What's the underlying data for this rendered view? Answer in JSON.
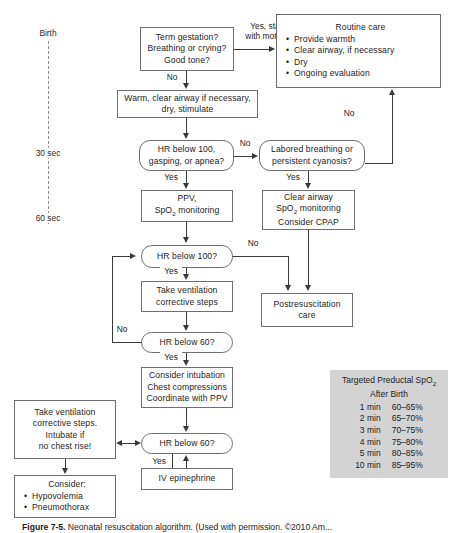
{
  "figure": {
    "caption_label": "Figure 7-5.",
    "caption_text": "Neonatal resuscitation algorithm. (Used with permission. ©2010 Am..."
  },
  "timeline": {
    "labels": [
      {
        "text": "Birth",
        "y": 28
      },
      {
        "text": "30 sec",
        "y": 148
      },
      {
        "text": "60 sec",
        "y": 213
      }
    ]
  },
  "nodes": {
    "initial_assessment": {
      "lines": [
        "Term gestation?",
        "Breathing or crying?",
        "Good tone?"
      ]
    },
    "routine_care": {
      "title": "Routine care",
      "items": [
        "Provide warmth",
        "Clear airway, if necessary",
        "Dry",
        "Ongoing evaluation"
      ]
    },
    "warm_clear": {
      "lines": [
        "Warm, clear airway if necessary,",
        "dry, stimulate"
      ]
    },
    "hr_below_100_gasping": {
      "lines": [
        "HR below 100,",
        "gasping, or apnea?"
      ]
    },
    "labored_breathing": {
      "lines": [
        "Labored breathing or",
        "persistent cyanosis?"
      ]
    },
    "ppv_spo2": {
      "lines": [
        "PPV,",
        "SpO",
        "₂",
        " monitoring"
      ],
      "line1": "PPV,",
      "line2_pre": "SpO",
      "line2_sub": "2",
      "line2_post": " monitoring"
    },
    "clear_airway": {
      "line1": "Clear airway",
      "line2_pre": "SpO",
      "line2_sub": "2",
      "line2_post": " monitoring",
      "line3": "Consider CPAP"
    },
    "hr_below_100": {
      "lines": [
        "HR below 100?"
      ]
    },
    "take_ventilation_steps": {
      "lines": [
        "Take ventilation",
        "corrective steps"
      ]
    },
    "postresuscitation": {
      "lines": [
        "Postresuscitation",
        "care"
      ]
    },
    "hr_below_60_first": {
      "lines": [
        "HR below 60?"
      ]
    },
    "consider_intubation": {
      "lines": [
        "Consider intubation",
        "Chest compressions",
        "Coordinate with PPV"
      ]
    },
    "hr_below_60_second": {
      "lines": [
        "HR below 60?"
      ]
    },
    "iv_epinephrine": {
      "lines": [
        "IV epinephrine"
      ]
    },
    "take_ventilation_intubate": {
      "lines": [
        "Take ventilation",
        "corrective steps.",
        "Intubate if",
        "no chest rise!"
      ]
    },
    "consider_causes": {
      "title": "Consider:",
      "items": [
        "Hypovolemia",
        "Pneumothorax"
      ]
    }
  },
  "edge_labels": {
    "yes_stay_with_mother": "Yes, stay\nwith mother",
    "yes_stay_line1": "Yes, stay",
    "yes_stay_line2": "with mother",
    "no_initial": "No",
    "no_to_labored": "No",
    "no_routine_return": "No",
    "yes_to_ppv": "Yes",
    "yes_to_clear_airway": "Yes",
    "no_hr100_to_post": "No",
    "yes_hr100": "Yes",
    "no_hr60": "No",
    "yes_hr60": "Yes",
    "yes_hr60_second": "Yes"
  },
  "spo2_table": {
    "title_pre": "Targeted Preductal SpO",
    "title_sub": "2",
    "title_line2": "After Birth",
    "rows": [
      {
        "time": "1 min",
        "range": "60–65%"
      },
      {
        "time": "2 min",
        "range": "65–70%"
      },
      {
        "time": "3 min",
        "range": "70–75%"
      },
      {
        "time": "4 min",
        "range": "75–80%"
      },
      {
        "time": "5 min",
        "range": "80–85%"
      },
      {
        "time": "10 min",
        "range": "85–95%"
      }
    ]
  },
  "colors": {
    "box_border": "#6f6f6f",
    "connector": "#3a3a3a",
    "table_bg": "#d3d3d3",
    "page_bg": "#ffffff"
  }
}
